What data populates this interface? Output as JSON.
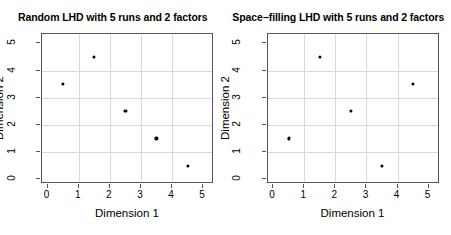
{
  "figure": {
    "background_color": "#ffffff",
    "point_color": "#000000",
    "grid_color": "#d9d9d9",
    "axis_color": "#555555"
  },
  "panels": [
    {
      "id": "random-lhd",
      "title": "Random LHD with 5 runs and 2 factors",
      "xlabel": "Dimension 1",
      "ylabel": "Dimension 2"
    },
    {
      "id": "space-filling-lhd",
      "title": "Space−filling LHD with 5 runs and 2 factors",
      "xlabel": "Dimension 1",
      "ylabel": "Dimension 2"
    }
  ],
  "ticks": {
    "x": [
      "0",
      "1",
      "2",
      "3",
      "4",
      "5"
    ],
    "y": [
      "0",
      "1",
      "2",
      "3",
      "4",
      "5"
    ]
  },
  "chart_data": [
    {
      "type": "scatter",
      "title": "Random LHD with 5 runs and 2 factors",
      "xlabel": "Dimension 1",
      "ylabel": "Dimension 2",
      "xlim": [
        -0.18,
        5.35
      ],
      "ylim": [
        -0.18,
        5.35
      ],
      "xticks": [
        0,
        1,
        2,
        3,
        4,
        5
      ],
      "yticks": [
        0,
        1,
        2,
        3,
        4,
        5
      ],
      "grid": true,
      "legend": "none",
      "marker": "filled-circle",
      "x": [
        0.5,
        1.5,
        2.5,
        3.5,
        4.5
      ],
      "y": [
        3.5,
        4.5,
        2.5,
        1.5,
        0.5
      ],
      "points": [
        {
          "x": 0.5,
          "y": 3.5
        },
        {
          "x": 1.5,
          "y": 4.5
        },
        {
          "x": 2.5,
          "y": 2.5
        },
        {
          "x": 3.5,
          "y": 1.5
        },
        {
          "x": 4.5,
          "y": 0.5
        }
      ]
    },
    {
      "type": "scatter",
      "title": "Space−filling LHD with 5 runs and 2 factors",
      "xlabel": "Dimension 1",
      "ylabel": "Dimension 2",
      "xlim": [
        -0.18,
        5.35
      ],
      "ylim": [
        -0.18,
        5.35
      ],
      "xticks": [
        0,
        1,
        2,
        3,
        4,
        5
      ],
      "yticks": [
        0,
        1,
        2,
        3,
        4,
        5
      ],
      "grid": true,
      "legend": "none",
      "marker": "filled-circle",
      "x": [
        0.5,
        1.5,
        2.5,
        3.5,
        4.5
      ],
      "y": [
        1.5,
        4.5,
        2.5,
        0.5,
        3.5
      ],
      "points": [
        {
          "x": 0.5,
          "y": 1.5
        },
        {
          "x": 1.5,
          "y": 4.5
        },
        {
          "x": 2.5,
          "y": 2.5
        },
        {
          "x": 3.5,
          "y": 0.5
        },
        {
          "x": 4.5,
          "y": 3.5
        }
      ]
    }
  ]
}
